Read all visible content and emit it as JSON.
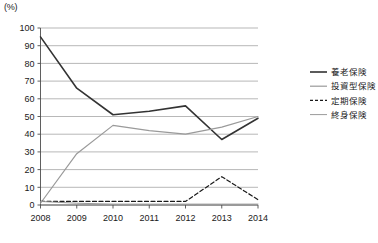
{
  "chart_data": {
    "type": "line",
    "title": "",
    "xlabel": "",
    "ylabel": "",
    "unit_label": "(%)",
    "categories": [
      "2008",
      "2009",
      "2010",
      "2011",
      "2012",
      "2013",
      "2014"
    ],
    "ylim": [
      0,
      100
    ],
    "yticks": [
      0,
      10,
      20,
      30,
      40,
      50,
      60,
      70,
      80,
      90,
      100
    ],
    "grid": true,
    "legend_position": "right",
    "series": [
      {
        "name": "養老保険",
        "color": "#333333",
        "style": "solid",
        "width": 1.6,
        "values": [
          95,
          66,
          51,
          53,
          56,
          37,
          49
        ]
      },
      {
        "name": "投資型保険",
        "color": "#9a9a9a",
        "style": "solid",
        "width": 1.2,
        "values": [
          1,
          29,
          45,
          42,
          40,
          44,
          50
        ]
      },
      {
        "name": "定期保険",
        "color": "#1a1a1a",
        "style": "dashed",
        "width": 1.2,
        "values": [
          2,
          2,
          2,
          2,
          2,
          16,
          3
        ]
      },
      {
        "name": "終身保険",
        "color": "#9a9a9a",
        "style": "solid",
        "width": 1.0,
        "values": [
          2,
          1,
          0.5,
          0.5,
          0.5,
          0.5,
          0.5
        ]
      }
    ]
  },
  "legend": {
    "items": [
      {
        "label": "養老保険"
      },
      {
        "label": "投資型保険"
      },
      {
        "label": "定期保険"
      },
      {
        "label": "終身保険"
      }
    ]
  },
  "yticks_text": [
    "100",
    "90",
    "80",
    "70",
    "60",
    "50",
    "40",
    "30",
    "20",
    "10",
    "0"
  ],
  "xticks_text": [
    "2008",
    "2009",
    "2010",
    "2011",
    "2012",
    "2013",
    "2014"
  ]
}
